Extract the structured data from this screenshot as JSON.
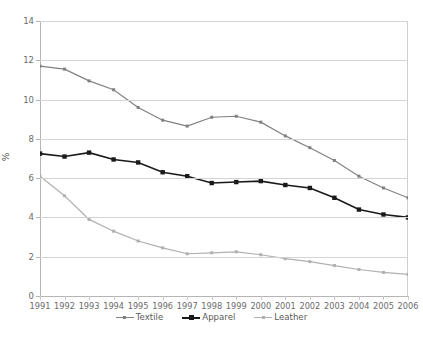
{
  "chart_data": {
    "type": "line",
    "title": "",
    "subtitle": "",
    "xlabel": "",
    "ylabel": "%",
    "categories": [
      "1991",
      "1992",
      "1993",
      "1994",
      "1995",
      "1996",
      "1997",
      "1998",
      "1999",
      "2000",
      "2001",
      "2002",
      "2003",
      "2004",
      "2005",
      "2006"
    ],
    "ylim": [
      0,
      14
    ],
    "ytick_labels": [
      "0",
      "2",
      "4",
      "6",
      "8",
      "10",
      "12",
      "14"
    ],
    "ytick_values": [
      0,
      2,
      4,
      6,
      8,
      10,
      12,
      14
    ],
    "grid": "horizontal",
    "legend_position": "bottom",
    "series": [
      {
        "name": "Textile",
        "color": "#808080",
        "marker": "square",
        "values": [
          11.7,
          11.55,
          10.95,
          10.5,
          9.6,
          8.95,
          8.65,
          9.1,
          9.15,
          8.85,
          8.15,
          7.55,
          6.9,
          6.1,
          5.5,
          5.0
        ]
      },
      {
        "name": "Apparel",
        "color": "#1a1a1a",
        "marker": "square",
        "values": [
          7.25,
          7.1,
          7.3,
          6.95,
          6.8,
          6.3,
          6.1,
          5.75,
          5.8,
          5.85,
          5.65,
          5.5,
          5.0,
          4.4,
          4.15,
          4.0
        ]
      },
      {
        "name": "Leather",
        "color": "#b0b0b0",
        "marker": "square",
        "values": [
          6.1,
          5.1,
          3.9,
          3.3,
          2.8,
          2.45,
          2.15,
          2.2,
          2.25,
          2.1,
          1.9,
          1.75,
          1.55,
          1.35,
          1.2,
          1.1
        ]
      }
    ]
  },
  "axis": {
    "y_label": "%"
  }
}
